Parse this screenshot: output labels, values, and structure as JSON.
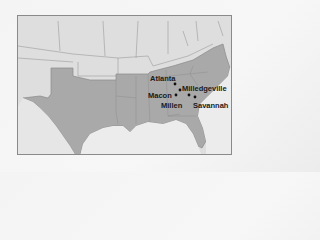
{
  "map": {
    "colors": {
      "background": "#e4e4e4",
      "confederacy": "#a9a9a9",
      "other_states": "#dcdcdc",
      "water": "#ededed",
      "borders": "#8f8f8f",
      "dot": "#111111"
    },
    "cities": [
      {
        "name": "Atlanta",
        "label_x": 132,
        "label_y": 59,
        "dot_x": 157,
        "dot_y": 68
      },
      {
        "name": "Milledgeville",
        "label_x": 164,
        "label_y": 69,
        "dot_x": 162,
        "dot_y": 74
      },
      {
        "name": "Macon",
        "label_x": 130,
        "label_y": 76,
        "dot_x": 158,
        "dot_y": 79
      },
      {
        "name": "Millen",
        "label_x": 143,
        "label_y": 86,
        "dot_x": 171,
        "dot_y": 79
      },
      {
        "name": "Savannah",
        "label_x": 175,
        "label_y": 86,
        "dot_x": 177,
        "dot_y": 81
      }
    ]
  }
}
